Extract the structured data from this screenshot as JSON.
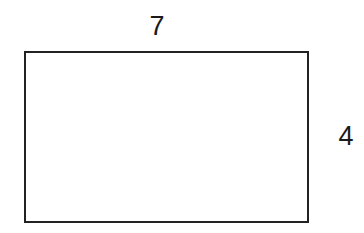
{
  "diagram": {
    "shape": "rectangle",
    "width_label": "7",
    "height_label": "4",
    "stroke_color": "#222222",
    "background_color": "#ffffff"
  }
}
